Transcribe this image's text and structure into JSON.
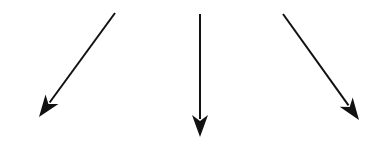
{
  "diagram": {
    "background": "#ffffff",
    "stroke_color": "#111111",
    "arrows": [
      {
        "name": "left",
        "x1": 115,
        "y1": 13,
        "x2": 39,
        "y2": 117
      },
      {
        "name": "center",
        "x1": 200,
        "y1": 14,
        "x2": 200,
        "y2": 137
      },
      {
        "name": "right",
        "x1": 283,
        "y1": 14,
        "x2": 359,
        "y2": 120
      }
    ]
  }
}
